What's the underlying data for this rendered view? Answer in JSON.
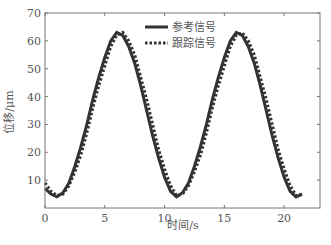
{
  "chart_data": {
    "type": "line",
    "title": "",
    "xlabel": "时间/s",
    "ylabel": "位移/μm",
    "xlim": [
      0,
      23
    ],
    "ylim": [
      0,
      70
    ],
    "xticks": [
      0,
      5,
      10,
      15,
      20
    ],
    "yticks": [
      10,
      20,
      30,
      40,
      50,
      60,
      70
    ],
    "grid": false,
    "legend_position": "top-center",
    "series": [
      {
        "name": "参考信号",
        "style": "solid",
        "x": [
          0,
          0.5,
          1,
          1.5,
          2,
          2.5,
          3,
          3.5,
          4,
          4.5,
          5,
          5.5,
          6,
          6.5,
          7,
          7.5,
          8,
          8.5,
          9,
          9.5,
          10,
          10.5,
          11,
          11.5,
          12,
          12.5,
          13,
          13.5,
          14,
          14.5,
          15,
          15.5,
          16,
          16.5,
          17,
          17.5,
          18,
          18.5,
          19,
          19.5,
          20,
          20.5,
          21,
          21.5
        ],
        "y": [
          7,
          5,
          4,
          5.5,
          9,
          15,
          22,
          30,
          39,
          47,
          54,
          60,
          63,
          62,
          58,
          52,
          44,
          35,
          26,
          18,
          11,
          6,
          4,
          5.5,
          9,
          15,
          22,
          30,
          39,
          47,
          54,
          60,
          63,
          62,
          58,
          52,
          44,
          35,
          26,
          18,
          11,
          6,
          4,
          5
        ]
      },
      {
        "name": "跟踪信号",
        "style": "dotted",
        "x": [
          0,
          0.5,
          1,
          1.5,
          2,
          2.5,
          3,
          3.5,
          4,
          4.5,
          5,
          5.5,
          6,
          6.5,
          7,
          7.5,
          8,
          8.5,
          9,
          9.5,
          10,
          10.5,
          11,
          11.5,
          12,
          12.5,
          13,
          13.5,
          14,
          14.5,
          15,
          15.5,
          16,
          16.5,
          17,
          17.5,
          18,
          18.5,
          19,
          19.5,
          20,
          20.5,
          21,
          21.5
        ],
        "y": [
          9,
          6,
          4.5,
          5,
          8,
          13,
          19,
          27,
          36,
          44,
          51,
          58,
          62,
          63,
          60,
          55,
          47,
          39,
          30,
          21,
          14,
          8,
          4.5,
          5,
          8,
          13,
          19,
          27,
          36,
          44,
          51,
          58,
          62,
          63,
          60,
          55,
          47,
          39,
          30,
          21,
          14,
          8,
          4.5,
          5
        ]
      }
    ]
  },
  "legend": {
    "ref": "参考信号",
    "track": "跟踪信号"
  },
  "axes": {
    "xlabel": "时间/s",
    "ylabel": "位移/μm"
  }
}
